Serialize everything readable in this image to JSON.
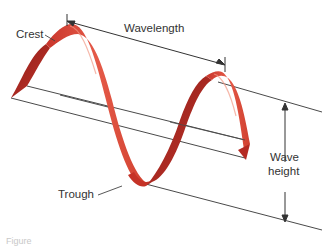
{
  "diagram": {
    "labels": {
      "crest": "Crest",
      "wavelength": "Wavelength",
      "trough": "Trough",
      "wave_height_line1": "Wave",
      "wave_height_line2": "height"
    },
    "caption": "Figure"
  },
  "colors": {
    "ribbon_front": "#d8453a",
    "ribbon_light": "#ee7a66",
    "ribbon_dark": "#a82620",
    "lines": "#4a4a4a",
    "text": "#333333"
  }
}
